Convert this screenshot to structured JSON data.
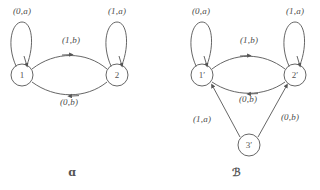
{
  "figure": {
    "stroke_color": "#555555",
    "text_color": "#4a4a4a",
    "background": "#ffffff"
  },
  "diagrams": [
    {
      "caption": "ɑ",
      "caption_label": "alpha",
      "states": [
        {
          "id": "1",
          "label": "1",
          "cx": 22,
          "cy": 75,
          "r": 11
        },
        {
          "id": "2",
          "label": "2",
          "cx": 117,
          "cy": 75,
          "r": 11
        }
      ],
      "self_loops": [
        {
          "from": "1",
          "label": "(0,a)",
          "label_x": 22,
          "label_y": 11
        },
        {
          "from": "2",
          "label": "(1,a)",
          "label_x": 117,
          "label_y": 11
        }
      ],
      "edges": [
        {
          "from": "1",
          "to": "2",
          "label": "(1,b)",
          "label_x": 71,
          "label_y": 40
        },
        {
          "from": "2",
          "to": "1",
          "label": "(0,b)",
          "label_x": 69,
          "label_y": 102
        }
      ]
    },
    {
      "caption": "ℬ",
      "caption_label": "beta",
      "states": [
        {
          "id": "1'",
          "label": "1′",
          "cx": 202,
          "cy": 75,
          "r": 11
        },
        {
          "id": "2'",
          "label": "2′",
          "cx": 295,
          "cy": 75,
          "r": 11
        },
        {
          "id": "3'",
          "label": "3′",
          "cx": 249,
          "cy": 145,
          "r": 11
        }
      ],
      "self_loops": [
        {
          "from": "1'",
          "label": "(0,a)",
          "label_x": 201,
          "label_y": 11
        },
        {
          "from": "2'",
          "label": "(1,a)",
          "label_x": 295,
          "label_y": 11
        }
      ],
      "edges": [
        {
          "from": "1'",
          "to": "2'",
          "label": "(1,b)",
          "label_x": 249,
          "label_y": 40
        },
        {
          "from": "2'",
          "to": "1'",
          "label": "(0,b)",
          "label_x": 248,
          "label_y": 99
        },
        {
          "from": "3'",
          "to": "1'",
          "label": "(1,a)",
          "label_x": 202,
          "label_y": 119
        },
        {
          "from": "3'",
          "to": "2'",
          "label": "(0,b)",
          "label_x": 290,
          "label_y": 117
        }
      ]
    }
  ],
  "captions": [
    {
      "text": "ɑ",
      "x": 72,
      "y": 172
    },
    {
      "text": "ℬ",
      "x": 236,
      "y": 172
    }
  ]
}
